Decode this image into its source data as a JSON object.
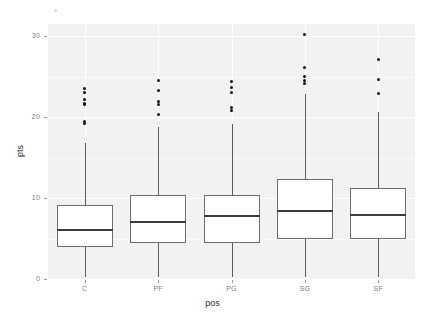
{
  "chart_data": {
    "type": "boxplot",
    "title": "",
    "xlabel": "pos",
    "ylabel": "pts",
    "categories": [
      "C",
      "PF",
      "PG",
      "SG",
      "SF"
    ],
    "ylim": [
      0,
      31.5
    ],
    "yticks": [
      0,
      10,
      20,
      30
    ],
    "ytick_labels": [
      "0",
      "10",
      "20",
      "30"
    ],
    "grid": true,
    "legend": "none",
    "series": [
      {
        "name": "C",
        "min": 0.3,
        "q1": 3.9,
        "median": 6.1,
        "q3": 9.1,
        "max": 16.8,
        "outliers": [
          19.2,
          19.4,
          21.5,
          21.7,
          22.2,
          23.0,
          23.5
        ]
      },
      {
        "name": "PF",
        "min": 0.3,
        "q1": 4.4,
        "median": 7.1,
        "q3": 10.4,
        "max": 18.8,
        "outliers": [
          20.3,
          21.5,
          21.9,
          23.3,
          24.5
        ]
      },
      {
        "name": "PG",
        "min": 0.2,
        "q1": 4.5,
        "median": 7.8,
        "q3": 10.4,
        "max": 19.2,
        "outliers": [
          20.8,
          21.2,
          23.0,
          23.6,
          24.4
        ]
      },
      {
        "name": "SG",
        "min": 0.3,
        "q1": 4.9,
        "median": 8.4,
        "q3": 12.4,
        "max": 22.8,
        "outliers": [
          24.2,
          24.5,
          25.0,
          26.1,
          30.2
        ]
      },
      {
        "name": "SF",
        "min": 0.3,
        "q1": 4.9,
        "median": 7.9,
        "q3": 11.3,
        "max": 20.6,
        "outliers": [
          22.9,
          24.6,
          27.1
        ]
      }
    ]
  },
  "axis": {
    "ytitle": "pts",
    "xtitle": "pos"
  }
}
